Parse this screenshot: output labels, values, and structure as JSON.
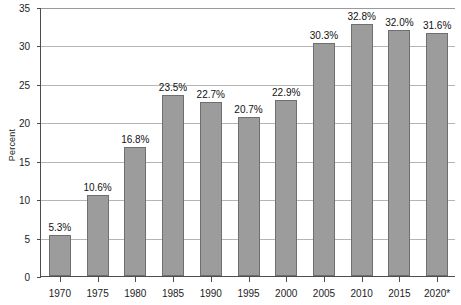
{
  "chart_data": {
    "type": "bar",
    "title": "",
    "xlabel": "",
    "ylabel": "Percent",
    "ylim": [
      0,
      35
    ],
    "ytick_values": [
      0,
      5,
      10,
      15,
      20,
      25,
      30,
      35
    ],
    "ytick_labels": [
      "0",
      "5",
      "10",
      "15",
      "20",
      "25",
      "30",
      "35"
    ],
    "grid": true,
    "legend": null,
    "categories": [
      "1970",
      "1975",
      "1980",
      "1985",
      "1990",
      "1995",
      "2000",
      "2005",
      "2010",
      "2015",
      "2020*"
    ],
    "values": [
      5.3,
      10.6,
      16.8,
      23.5,
      22.7,
      20.7,
      22.9,
      30.3,
      32.8,
      32.0,
      31.6
    ],
    "data_labels": [
      "5.3%",
      "10.6%",
      "16.8%",
      "23.5%",
      "22.7%",
      "20.7%",
      "22.9%",
      "30.3%",
      "32.8%",
      "32.0%",
      "31.6%"
    ],
    "bar_color": "#9c9c9c",
    "bar_edge_color": "#6f6f6f",
    "axis_color": "#4d4d4d",
    "gridline_color": "#b5b5b5",
    "text_color": "#1c1c1c"
  }
}
